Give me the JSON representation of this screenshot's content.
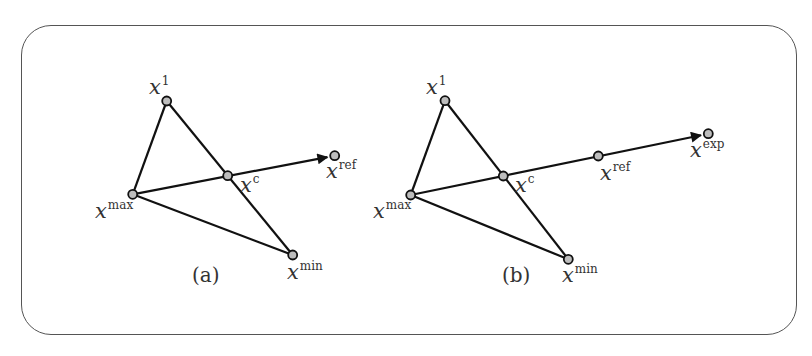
{
  "figure": {
    "panels": [
      {
        "id": "a",
        "label": "(a)",
        "label_pos": [
          192,
          282
        ],
        "nodes": [
          {
            "name": "x1",
            "base": "x",
            "sup": "1",
            "pos": [
              166.7,
              101
            ],
            "label_pos": [
              149,
              94
            ]
          },
          {
            "name": "xmax",
            "base": "x",
            "sup": "max",
            "pos": [
              132.7,
              194.3
            ],
            "label_pos": [
              95,
              218
            ]
          },
          {
            "name": "xc",
            "base": "x",
            "sup": "c",
            "pos": [
              227.7,
              175.7
            ],
            "label_pos": [
              240,
              192
            ]
          },
          {
            "name": "xref",
            "base": "x",
            "sup": "ref",
            "pos": [
              334.7,
              155.7
            ],
            "label_pos": [
              326,
              178
            ]
          },
          {
            "name": "xmin",
            "base": "x",
            "sup": "min",
            "pos": [
              292.7,
              255
            ],
            "label_pos": [
              287,
              279
            ]
          }
        ],
        "edges": [
          {
            "from": "xmax",
            "to": "x1"
          },
          {
            "from": "x1",
            "to": "xmin"
          },
          {
            "from": "xmax",
            "to": "xmin"
          },
          {
            "from": "xmax",
            "to": "xref",
            "arrow": true
          }
        ]
      },
      {
        "id": "b",
        "label": "(b)",
        "label_pos": [
          502,
          282
        ],
        "nodes": [
          {
            "name": "x1",
            "base": "x",
            "sup": "1",
            "pos": [
              445,
              100.7
            ],
            "label_pos": [
              426,
              94
            ]
          },
          {
            "name": "xmax",
            "base": "x",
            "sup": "max",
            "pos": [
              410.7,
              195
            ],
            "label_pos": [
              373,
              218
            ]
          },
          {
            "name": "xc",
            "base": "x",
            "sup": "c",
            "pos": [
              503.3,
              176
            ],
            "label_pos": [
              515,
              192
            ]
          },
          {
            "name": "xref",
            "base": "x",
            "sup": "ref",
            "pos": [
              598.3,
              156
            ],
            "label_pos": [
              600,
              180
            ]
          },
          {
            "name": "xexp",
            "base": "x",
            "sup": "exp",
            "pos": [
              708.3,
              133.7
            ],
            "label_pos": [
              690,
              157
            ]
          },
          {
            "name": "xmin",
            "base": "x",
            "sup": "min",
            "pos": [
              568.3,
              259.3
            ],
            "label_pos": [
              562,
              282
            ]
          }
        ],
        "edges": [
          {
            "from": "xmax",
            "to": "x1"
          },
          {
            "from": "x1",
            "to": "xmin"
          },
          {
            "from": "xmax",
            "to": "xmin"
          },
          {
            "from": "xmax",
            "to": "xexp",
            "arrow": true
          }
        ]
      }
    ],
    "colors": {
      "stroke": "#111111",
      "node_fill": "#bdbdbd",
      "frame": "#555555",
      "text": "#333333"
    }
  }
}
